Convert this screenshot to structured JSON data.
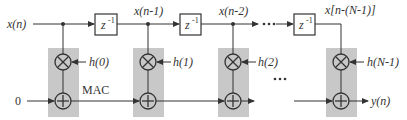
{
  "diagram": {
    "colors": {
      "line": "#333333",
      "mac_fill": "#c8c8c8",
      "box_fill": "#ffffff",
      "background": "#ffffff"
    },
    "input_label": "x(n)",
    "output_label": "y(n)",
    "initial_value": "0",
    "mac_label": "MAC",
    "delay_label": "z",
    "delay_exp": "-1",
    "ellipsis": "• • •",
    "taps": [
      {
        "signal": "x(n)",
        "coef": "h(0)"
      },
      {
        "signal": "x(n-1)",
        "coef": "h(1)"
      },
      {
        "signal": "x(n-2)",
        "coef": "h(2)"
      },
      {
        "signal": "x[n-(N-1)]",
        "coef": "h(N-1)"
      }
    ],
    "icons": [
      "multiplier-icon",
      "adder-icon",
      "arrow-icon"
    ]
  }
}
